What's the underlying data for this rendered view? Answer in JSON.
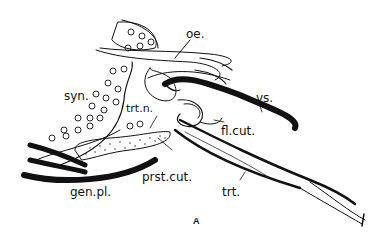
{
  "figure": {
    "panel_label": "A",
    "labels": {
      "oe": "oe.",
      "syn": "syn.",
      "trtn": "trt.n.",
      "vs": "vs.",
      "flcut": "fl.cut.",
      "prstcut": "prst.cut.",
      "genpl": "gen.pl.",
      "trt": "trt."
    },
    "colors": {
      "ink": "#111111",
      "background": "#ffffff"
    }
  }
}
